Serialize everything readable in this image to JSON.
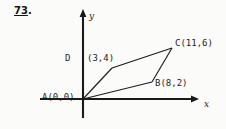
{
  "problem": {
    "number": "73",
    "period": "."
  },
  "figure": {
    "axes": {
      "x_label": "x",
      "y_label": "y",
      "origin_px": [
        83,
        99
      ],
      "x_axis_from_px": [
        40,
        99
      ],
      "x_axis_to_px": [
        196,
        99
      ],
      "y_axis_from_px": [
        83,
        118
      ],
      "y_axis_to_px": [
        83,
        10
      ],
      "arrow_x": true,
      "arrow_y": true,
      "grid": false,
      "tick_labels": []
    },
    "stroke_color": "#1d1d1d",
    "axis_color": "#1a1a1a",
    "background_color": "#fbfbfa",
    "vertices": [
      {
        "name": "A",
        "label": "A(0,0)",
        "coords": [
          0,
          0
        ],
        "px": [
          83,
          99
        ]
      },
      {
        "name": "B",
        "label": "B(8,2)",
        "coords": [
          8,
          2
        ],
        "px": [
          152,
          82
        ]
      },
      {
        "name": "C",
        "label": "C(11,6)",
        "coords": [
          11,
          6
        ],
        "px": [
          172,
          48
        ]
      },
      {
        "name": "D",
        "label_letter": "D",
        "label_coords": "(3,4)",
        "label": "D (3,4)",
        "coords": [
          3,
          4
        ],
        "px": [
          112,
          68
        ]
      }
    ],
    "edges": [
      {
        "from": "A",
        "to": "B"
      },
      {
        "from": "B",
        "to": "C"
      },
      {
        "from": "C",
        "to": "D"
      },
      {
        "from": "D",
        "to": "A"
      }
    ]
  }
}
